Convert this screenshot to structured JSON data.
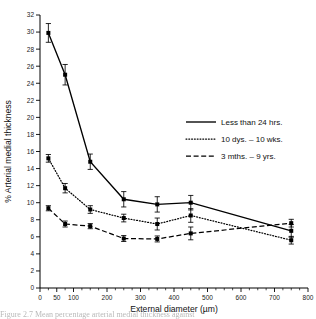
{
  "figure": {
    "caption_fragment": "Figure  2.7  Mean percentage arterial medial thickness against"
  },
  "chart_data": {
    "type": "line",
    "title": "",
    "xlabel": "External diameter (µm)",
    "ylabel": "% Arterial medial thickness",
    "xlim": [
      0,
      800
    ],
    "ylim": [
      0,
      32
    ],
    "xticks": [
      0,
      50,
      100,
      200,
      300,
      400,
      500,
      600,
      700,
      800
    ],
    "xticklabels": [
      "0",
      "50",
      "100",
      "200",
      "300",
      "400",
      "500",
      "600",
      "700",
      "800"
    ],
    "yticks": [
      0,
      2,
      4,
      6,
      8,
      10,
      12,
      14,
      16,
      18,
      20,
      22,
      24,
      26,
      28,
      30,
      32
    ],
    "yticklabels": [
      "0",
      "2",
      "4",
      "6",
      "8",
      "10",
      "12",
      "14",
      "16",
      "18",
      "20",
      "22",
      "24",
      "26",
      "28",
      "30",
      "32"
    ],
    "x": [
      25,
      75,
      150,
      250,
      350,
      450,
      750
    ],
    "grid": false,
    "legend_position": "center-right",
    "series": [
      {
        "name": "Less than 24 hrs.",
        "style": "solid",
        "values": [
          29.9,
          25.0,
          14.8,
          10.4,
          9.8,
          10.0,
          6.7
        ],
        "errors": [
          1.1,
          1.2,
          0.9,
          0.9,
          0.9,
          0.85,
          0.75
        ]
      },
      {
        "name": "10 dys. – 10 wks.",
        "style": "dotted",
        "values": [
          15.2,
          11.7,
          9.2,
          8.2,
          7.5,
          8.5,
          5.6
        ],
        "errors": [
          0.45,
          0.55,
          0.45,
          0.45,
          0.7,
          0.8,
          0.45
        ]
      },
      {
        "name": "3 mths. – 9 yrs.",
        "style": "dashed",
        "values": [
          9.35,
          7.5,
          7.25,
          5.8,
          5.75,
          6.4,
          7.6
        ],
        "errors": [
          0.3,
          0.35,
          0.3,
          0.35,
          0.35,
          0.75,
          0.45
        ]
      }
    ]
  }
}
